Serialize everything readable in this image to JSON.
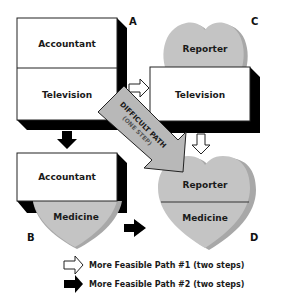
{
  "diagram": {
    "quadrants": {
      "A": {
        "corner_label": "A",
        "top": "Accountant",
        "bottom": "Television"
      },
      "B": {
        "corner_label": "B",
        "top": "Accountant",
        "bottom": "Medicine"
      },
      "C": {
        "corner_label": "C",
        "top": "Reporter",
        "bottom": "Television"
      },
      "D": {
        "corner_label": "D",
        "top": "Reporter",
        "bottom": "Medicine"
      }
    },
    "difficult_path": {
      "label": "DIFFICULT PATH",
      "sublabel": "(ONE STEP)"
    },
    "legend": [
      {
        "icon": "white-arrow-icon",
        "text": "More Feasible Path #1 (two steps)"
      },
      {
        "icon": "black-arrow-icon",
        "text": "More Feasible Path #2 (two steps)"
      }
    ],
    "colors": {
      "box_fill": "#ffffff",
      "shadow": "#000000",
      "heart_fill": "#c4c4c4",
      "heart_shade": "#a8a8a8",
      "outline": "#222222"
    }
  }
}
